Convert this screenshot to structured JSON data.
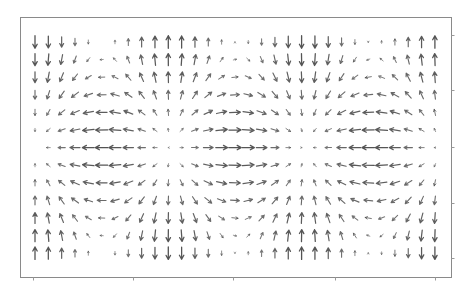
{
  "chart_data": {
    "type": "quiver",
    "title": "",
    "xlabel": "",
    "ylabel": "",
    "grid": false,
    "legend": null,
    "tick_labels": {
      "x": [],
      "y": []
    },
    "frame": {
      "left": 20,
      "top": 17,
      "right": 451,
      "bottom": 277
    },
    "x_ticks_px": [
      33,
      133,
      233,
      335,
      435
    ],
    "y_ticks_px_right": [
      35,
      90,
      147,
      203,
      258
    ],
    "columns": 31,
    "rows": 13,
    "x0_px": 35,
    "dx_px": 13.33,
    "y0_px": 42,
    "dy_px": 17.6,
    "formula": "u = -sin_a[i]*sin_b[j]; v = -cos_a[i]*cos_b[j] (v positive = up)",
    "sin_a": [
      0,
      0.305,
      0.581,
      0.802,
      0.946,
      1.0,
      0.958,
      0.826,
      0.613,
      0.343,
      0.04,
      -0.267,
      -0.55,
      -0.778,
      -0.934,
      -0.998,
      -0.968,
      -0.849,
      -0.643,
      -0.38,
      -0.079,
      0.229,
      0.518,
      0.755,
      0.92,
      0.995,
      0.976,
      0.871,
      0.673,
      0.416,
      0.118
    ],
    "cos_a": [
      1,
      0.952,
      0.814,
      0.597,
      0.324,
      0.02,
      -0.286,
      -0.564,
      -0.79,
      -0.939,
      -0.999,
      -0.964,
      -0.835,
      -0.629,
      -0.357,
      -0.06,
      0.251,
      0.529,
      0.766,
      0.925,
      0.997,
      0.974,
      0.855,
      0.656,
      0.391,
      0.099,
      -0.217,
      -0.492,
      -0.74,
      -0.909,
      -0.993
    ],
    "sin_b": [
      0,
      0.259,
      0.5,
      0.707,
      0.866,
      0.966,
      1,
      0.966,
      0.866,
      0.707,
      0.5,
      0.259,
      0
    ],
    "cos_b": [
      1,
      0.966,
      0.866,
      0.707,
      0.5,
      0.259,
      0,
      -0.259,
      -0.5,
      -0.707,
      -0.866,
      -0.966,
      -1
    ],
    "max_arrow_px": 12.5,
    "arrow_color": "#4a4a4a"
  }
}
